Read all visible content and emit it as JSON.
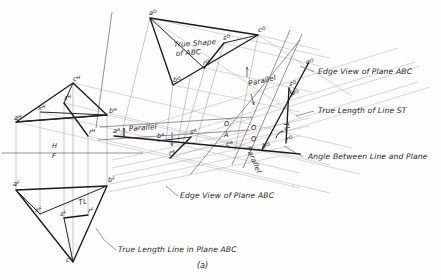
{
  "figure": {
    "caption": "(a)"
  },
  "annotations": [
    {
      "id": "true-shape",
      "text": "True Shape",
      "x": 174,
      "y": 47
    },
    {
      "id": "true-shape-2",
      "text": "of ABC",
      "x": 176,
      "y": 56
    },
    {
      "id": "edge-view-right",
      "text": "Edge View of Plane ABC",
      "x": 318,
      "y": 74
    },
    {
      "id": "true-length-st",
      "text": "True Length of Line ST",
      "x": 318,
      "y": 113
    },
    {
      "id": "angle-line-plane",
      "text": "Angle Between Line and Plane",
      "x": 308,
      "y": 159
    },
    {
      "id": "edge-view-lower",
      "text": "Edge View of Plane ABC",
      "x": 180,
      "y": 198
    },
    {
      "id": "true-length-line",
      "text": "True Length Line in Plane ABC",
      "x": 118,
      "y": 252
    },
    {
      "id": "parallel-top",
      "text": "Parallel",
      "x": 249,
      "y": 86
    },
    {
      "id": "parallel-aux",
      "text": "Parallel",
      "x": 129,
      "y": 131
    },
    {
      "id": "parallel-q",
      "text": "Parallel",
      "x": 246,
      "y": 148
    },
    {
      "id": "tl-front",
      "text": "TL",
      "x": 79,
      "y": 205
    },
    {
      "id": "tl-q",
      "text": "TL",
      "x": 283,
      "y": 123
    }
  ],
  "reference_lines": [
    {
      "id": "hf",
      "upper": "H",
      "lower": "F",
      "x": 52,
      "y_upper": 148,
      "y_lower": 158
    },
    {
      "id": "oa",
      "upper": "O",
      "lower": "A",
      "x": 224,
      "y_upper": 126,
      "y_lower": 137
    },
    {
      "id": "oq",
      "upper": "O",
      "lower": "Q",
      "x": 251,
      "y_upper": 130,
      "y_lower": 141
    }
  ],
  "points": {
    "top_view": [
      {
        "label": "c",
        "view": "H",
        "x": 73,
        "y": 81
      },
      {
        "label": "a",
        "view": "H",
        "x": 14,
        "y": 120
      },
      {
        "label": "b",
        "view": "H",
        "x": 109,
        "y": 113
      },
      {
        "label": "x",
        "view": "H",
        "x": 38,
        "y": 110
      },
      {
        "label": "s",
        "view": "H",
        "x": 64,
        "y": 100
      },
      {
        "label": "r",
        "view": "H",
        "x": 89,
        "y": 134
      }
    ],
    "front_view": [
      {
        "label": "a",
        "view": "F",
        "x": 13,
        "y": 186
      },
      {
        "label": "b",
        "view": "F",
        "x": 108,
        "y": 182
      },
      {
        "label": "c",
        "view": "F",
        "x": 66,
        "y": 262
      },
      {
        "label": "x",
        "view": "F",
        "x": 35,
        "y": 212
      },
      {
        "label": "s",
        "view": "F",
        "x": 60,
        "y": 216
      },
      {
        "label": "r",
        "view": "F",
        "x": 88,
        "y": 213
      }
    ],
    "auxiliary_view_a": [
      {
        "label": "a",
        "view": "A",
        "x": 113,
        "y": 133
      },
      {
        "label": "b",
        "view": "A",
        "x": 157,
        "y": 138
      },
      {
        "label": "c",
        "view": "A",
        "x": 226,
        "y": 146
      },
      {
        "label": "s",
        "view": "A",
        "x": 190,
        "y": 134
      },
      {
        "label": "r",
        "view": "A",
        "x": 169,
        "y": 155
      }
    ],
    "secondary_view_q": [
      {
        "label": "c",
        "view": "Q",
        "x": 306,
        "y": 64
      },
      {
        "label": "s",
        "view": "Q",
        "x": 289,
        "y": 86
      },
      {
        "label": "a",
        "view": "Q",
        "x": 291,
        "y": 95
      },
      {
        "label": "b",
        "view": "Q",
        "x": 262,
        "y": 148
      },
      {
        "label": "r",
        "view": "Q",
        "x": 286,
        "y": 141
      }
    ],
    "true_shape_view_o": [
      {
        "label": "a",
        "view": "O",
        "x": 149,
        "y": 15
      },
      {
        "label": "c",
        "view": "O",
        "x": 258,
        "y": 32
      },
      {
        "label": "b",
        "view": "O",
        "x": 173,
        "y": 82
      },
      {
        "label": "s",
        "view": "O",
        "x": 223,
        "y": 40
      },
      {
        "label": "r",
        "view": "O",
        "x": 203,
        "y": 65
      }
    ]
  },
  "colors": {
    "object_line": "#1a1a1a",
    "construction_line": "#8e8e8e",
    "reference_line": "#6f6f6f",
    "background": "#fdfdfd",
    "text": "#232323"
  }
}
